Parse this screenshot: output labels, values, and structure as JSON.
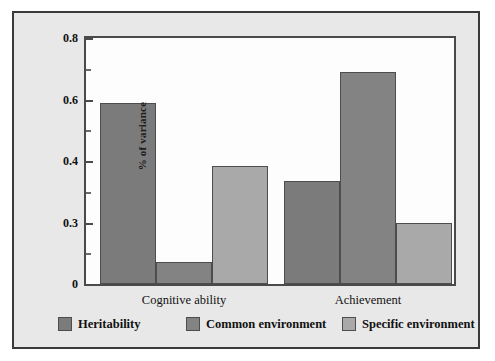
{
  "chart_data": {
    "type": "bar",
    "title": "",
    "subtitle": "",
    "xlabel": "",
    "ylabel": "% of variance",
    "categories": [
      "Cognitive ability",
      "Achievement"
    ],
    "series": [
      {
        "name": "Heritability",
        "color": "#7b7b7b",
        "values": [
          0.59,
          0.335
        ]
      },
      {
        "name": "Common environment",
        "color": "#838383",
        "values": [
          0.07,
          0.69
        ]
      },
      {
        "name": "Specific environment",
        "color": "#a9a9a9",
        "values": [
          0.385,
          0.2
        ]
      }
    ],
    "ylim": [
      0,
      0.8
    ],
    "ytick_labels": [
      "0.8",
      "0.6",
      "0.4",
      "0.3",
      "0"
    ],
    "ytick_values": [
      0.8,
      0.6,
      0.4,
      0.2,
      0.0
    ],
    "yminor_values": [
      0.7,
      0.5,
      0.3,
      0.1
    ],
    "grid": false,
    "legend_position": "bottom",
    "annotations": []
  },
  "legend": {
    "items": [
      {
        "label": "Heritability",
        "color": "#7b7b7b"
      },
      {
        "label": "Common environment",
        "color": "#838383"
      },
      {
        "label": "Specific environment",
        "color": "#a9a9a9"
      }
    ]
  },
  "colors": {
    "page_background": "#e8e8e8",
    "plot_background": "#fdfdfd",
    "frame_border": "#3a3a3a",
    "axis": "#4a4a4a",
    "text": "#111111"
  }
}
